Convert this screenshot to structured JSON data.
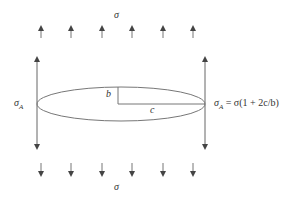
{
  "diagram": {
    "labels": {
      "top_stress": "σ",
      "bottom_stress": "σ",
      "left_stress": "σ",
      "left_stress_sub": "A",
      "right_stress": "σ",
      "right_stress_sub": "A",
      "right_formula": " = σ(1 + 2c/b)",
      "semi_minor": "b",
      "semi_major": "c"
    },
    "arrows": {
      "top_x": [
        41,
        71,
        102,
        132,
        163,
        193
      ],
      "bottom_x": [
        41,
        71,
        102,
        132,
        163,
        193
      ],
      "color": "#555555"
    },
    "ellipse": {
      "cx": 121,
      "cy": 104,
      "rx": 84,
      "ry": 17,
      "stroke": "#666666"
    }
  }
}
